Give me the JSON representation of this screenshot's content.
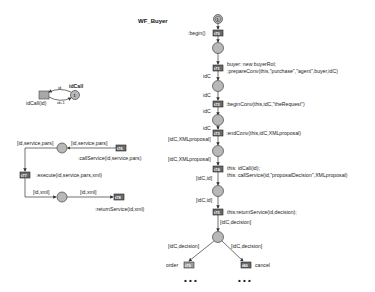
{
  "title": "WF_Buyer",
  "main_net": {
    "start_place_label": "1",
    "transitions": [
      {
        "id": "t70",
        "label": "t70",
        "action": ":begin()"
      },
      {
        "id": "t71",
        "label": "t71",
        "action_lines": [
          "buyer: new buyerRol;",
          ":prepareConv(this,\"purchase\",\"agent\",buyer,idC)"
        ]
      },
      {
        "id": "t72",
        "label": "t72",
        "action": ":beginConv(this,idC,\"theRequest\")"
      },
      {
        "id": "t73",
        "label": "t73",
        "action": ":endConv(this,idC,XMLproposal)"
      },
      {
        "id": "t74",
        "label": "t74",
        "action_lines": [
          "this: idCall(id);",
          "this: callService(id,\"proposalDecision\",XMLproposal)"
        ]
      },
      {
        "id": "t75",
        "label": "t75",
        "action": "this:returnService(id,decision);"
      },
      {
        "id": "t79",
        "label": "t79",
        "action": "order"
      },
      {
        "id": "t80",
        "label": "t80",
        "action": "cancel"
      }
    ],
    "arc_labels": {
      "a1": "idC",
      "a2": "idC",
      "a3": "idC",
      "a4": "[idC,XMLproposal]",
      "a5": "[idC,XMLproposal]",
      "a6": "[idC,id]",
      "a7": "[idC,id]",
      "a8": "[idC,decision]",
      "a9": "[idC,decision]",
      "a10": "[idC,decision]"
    },
    "continuation": "• • •"
  },
  "idcall_net": {
    "place_label": "idCall",
    "place_token": "1",
    "transition_label": "idCall(id)",
    "arc_top": "id",
    "arc_bottom": "id+1"
  },
  "service_net": {
    "arc_labels": {
      "in_left": "[id,service,pars]",
      "in_right": "[id,service,pars]",
      "out_left": "[id,xml]",
      "out_right": "[id,xml]"
    },
    "transitions": [
      {
        "id": "t76",
        "label": "t76",
        "action": ":callService(id,service,pars)"
      },
      {
        "id": "t77",
        "label": "t77",
        "action": ":execute(id,service,pars,xml)"
      },
      {
        "id": "t78",
        "label": "t78",
        "action": ":returnService(id,xml)"
      }
    ]
  }
}
